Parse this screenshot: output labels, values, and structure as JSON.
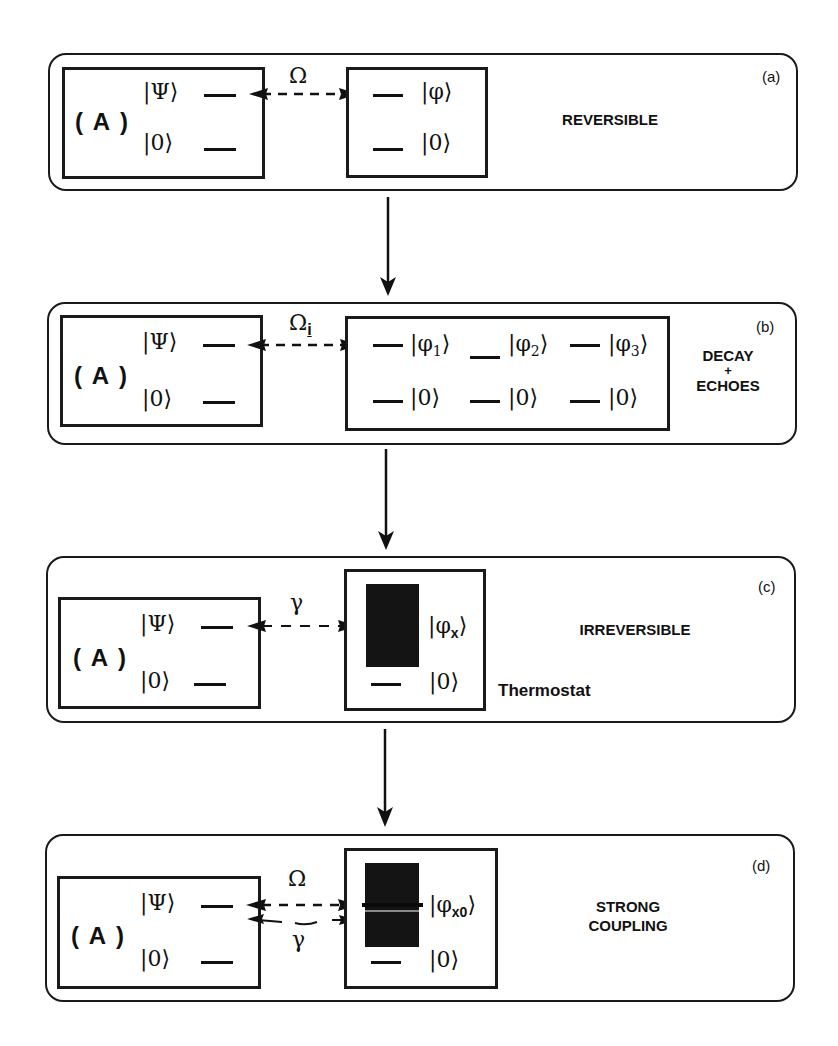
{
  "figure": {
    "connector_arrows": 3,
    "panels": [
      {
        "id": "a",
        "tag": "(a)",
        "regime_label": "REVERSIBLE",
        "system": {
          "name": "( A )",
          "upper_state": "|Ψ⟩",
          "lower_state": "|0⟩"
        },
        "coupling": {
          "symbol": "Ω",
          "arrow": "bidirectional-dashed"
        },
        "partner": {
          "upper_state": "|φ⟩",
          "lower_state": "|0⟩"
        }
      },
      {
        "id": "b",
        "tag": "(b)",
        "regime_label_line1": "DECAY",
        "regime_label_plus": "+",
        "regime_label_line2": "ECHOES",
        "system": {
          "name": "( A )",
          "upper_state": "|Ψ⟩",
          "lower_state": "|0⟩"
        },
        "coupling": {
          "symbol": "Ω",
          "subscript": "i",
          "arrow": "bidirectional-dashed"
        },
        "partner": {
          "upper_states": [
            "|φ",
            "|φ",
            "|φ"
          ],
          "upper_subscripts": [
            "1",
            "2",
            "3"
          ],
          "ket_close": "⟩",
          "lower_states": [
            "|0⟩",
            "|0⟩",
            "|0⟩"
          ]
        }
      },
      {
        "id": "c",
        "tag": "(c)",
        "regime_label": "IRREVERSIBLE",
        "reservoir_label": "Thermostat",
        "system": {
          "name": "( A )",
          "upper_state": "|Ψ⟩",
          "lower_state": "|0⟩"
        },
        "coupling": {
          "symbol": "γ",
          "arrow": "bidirectional-dashed"
        },
        "partner": {
          "upper_state": "|φ",
          "upper_subscript": "x",
          "ket_close": "⟩",
          "lower_state": "|0⟩",
          "continuum": true
        }
      },
      {
        "id": "d",
        "tag": "(d)",
        "regime_label_line1": "STRONG",
        "regime_label_line2": "COUPLING",
        "system": {
          "name": "( A )",
          "upper_state": "|Ψ⟩",
          "lower_state": "|0⟩"
        },
        "coupling": {
          "symbol_top": "Ω",
          "symbol_bottom": "γ",
          "arrow": "double-bidirectional"
        },
        "partner": {
          "upper_state": "|φ",
          "upper_subscript": "x0",
          "ket_close": "⟩",
          "lower_state": "|0⟩",
          "continuum": true,
          "discrete_line": true
        }
      }
    ]
  }
}
